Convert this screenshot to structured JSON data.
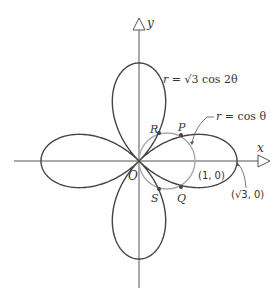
{
  "diagram": {
    "type": "polar-curves",
    "axes": {
      "x_label": "x",
      "y_label": "y",
      "origin_label": "O"
    },
    "curves": [
      {
        "name": "rose",
        "equation": "r = √3 cos 2θ",
        "label_r": "r",
        "label_rest": " = √3 cos 2θ",
        "color": "#444444",
        "amplitude": 1.732
      },
      {
        "name": "circle",
        "equation": "r = cos θ",
        "label_r": "r",
        "label_rest": " = cos θ",
        "color": "#aaaaaa"
      }
    ],
    "points": [
      {
        "name": "P",
        "label": "P"
      },
      {
        "name": "Q",
        "label": "Q"
      },
      {
        "name": "R",
        "label": "R"
      },
      {
        "name": "S",
        "label": "S"
      }
    ],
    "annotations": {
      "one_zero": "(1, 0)",
      "sqrt3_zero": "(√3, 0)"
    }
  }
}
